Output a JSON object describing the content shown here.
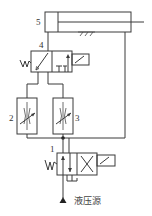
{
  "diagram": {
    "type": "hydraulic-circuit",
    "labels": {
      "cylinder": "5",
      "valve_top": "4",
      "throttle_left": "2",
      "throttle_right": "3",
      "valve_bottom": "1",
      "source": "液压源"
    },
    "components": [
      {
        "id": "5",
        "name": "hydraulic cylinder (single rod)"
      },
      {
        "id": "4",
        "name": "2-position solenoid directional valve (spring return)"
      },
      {
        "id": "2",
        "name": "adjustable throttle valve"
      },
      {
        "id": "3",
        "name": "adjustable throttle valve"
      },
      {
        "id": "1",
        "name": "2-position 4-way solenoid directional valve (spring return)"
      }
    ],
    "colors": {
      "line": "#3a3a3a",
      "background": "#ffffff"
    }
  }
}
